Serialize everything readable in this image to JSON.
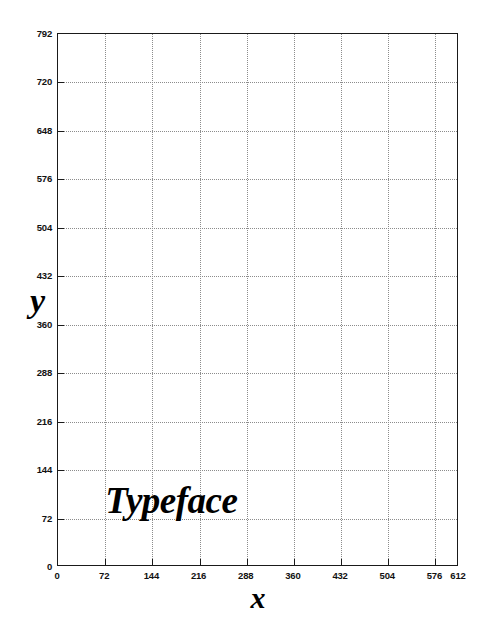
{
  "chart_data": {
    "type": "scatter",
    "title": "",
    "xlabel": "x",
    "ylabel": "y",
    "xlim": [
      0,
      612
    ],
    "ylim": [
      0,
      792
    ],
    "grid": true,
    "legend": null,
    "x_ticks": [
      0,
      72,
      144,
      216,
      288,
      360,
      432,
      504,
      576,
      612
    ],
    "x_tick_labels": [
      "0",
      "72",
      "144",
      "216",
      "288",
      "360",
      "432",
      "504",
      "576",
      "612"
    ],
    "y_ticks": [
      0,
      72,
      144,
      216,
      288,
      360,
      432,
      504,
      576,
      648,
      720,
      792
    ],
    "y_tick_labels": [
      "0",
      "72",
      "144",
      "216",
      "288",
      "360",
      "432",
      "504",
      "576",
      "648",
      "720",
      "792"
    ],
    "x_gridlines": [
      72,
      144,
      216,
      288,
      360,
      432,
      504,
      576
    ],
    "y_gridlines": [
      72,
      144,
      216,
      288,
      360,
      432,
      504,
      576,
      648,
      720
    ],
    "series": [],
    "annotations": [
      {
        "text": "Typeface",
        "x": 72,
        "y": 72,
        "style": "bold-italic-serif"
      }
    ],
    "colors": {
      "background": "#ffffff",
      "frame": "#1a1a1a",
      "grid": "#8c8c8c",
      "text": "#111111",
      "annotation": "#000000"
    }
  },
  "axis_titles": {
    "x": "x",
    "y": "y"
  }
}
